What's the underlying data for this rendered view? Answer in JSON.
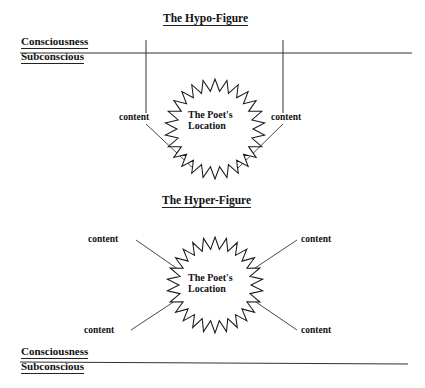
{
  "diagram": {
    "title_hypo": "The Hypo-Figure",
    "title_hyper": "The Hyper-Figure",
    "layer_top": {
      "upper": "Consciousness",
      "lower": "Subconscious"
    },
    "layer_bottom": {
      "upper": "Consciousness",
      "lower": "Subconscious"
    },
    "center_label": {
      "line1": "The Poet's",
      "line2": "Location"
    },
    "hypo": {
      "center_line1": "The Poet's",
      "center_line2": "Location",
      "content_left": "content",
      "content_right": "content"
    },
    "hyper": {
      "center_line1": "The Poet's",
      "center_line2": "Location",
      "content_top_left": "content",
      "content_top_right": "content",
      "content_bottom_left": "content",
      "content_bottom_right": "content"
    },
    "colors": {
      "ink": "#111111",
      "rule": "#222222",
      "background": "#ffffff"
    }
  }
}
